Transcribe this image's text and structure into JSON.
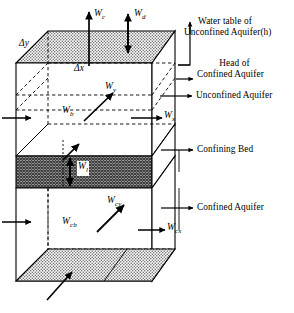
{
  "figure": {
    "type": "3d-block-diagram"
  },
  "dimension_labels": [
    {
      "id": "dy",
      "symbol": "Δy",
      "meaning": "cell width in y direction"
    },
    {
      "id": "dx",
      "symbol": "Δx",
      "meaning": "cell width in x direction"
    }
  ],
  "flux_labels": [
    {
      "id": "Wc",
      "base": "W",
      "sub": "c",
      "meaning": "recharge flux at water table, upward arrow"
    },
    {
      "id": "Wd",
      "base": "W",
      "sub": "d",
      "meaning": "drainage / exchange flux, double headed vertical arrow"
    },
    {
      "id": "Wy",
      "base": "W",
      "sub": "y",
      "meaning": "unconfined aquifer flux in y direction"
    },
    {
      "id": "Wb",
      "base": "W",
      "sub": "b",
      "meaning": "unconfined aquifer back face flux"
    },
    {
      "id": "Wx",
      "base": "W",
      "sub": "x",
      "meaning": "unconfined aquifer flux in x direction"
    },
    {
      "id": "Wl",
      "base": "W",
      "sub": "l",
      "meaning": "leakage flux through confining bed, double headed vertical arrow"
    },
    {
      "id": "Wcy",
      "base": "W",
      "sub": "cy",
      "meaning": "confined aquifer flux in y direction"
    },
    {
      "id": "Wcb",
      "base": "W",
      "sub": "cb",
      "meaning": "confined aquifer back face flux"
    },
    {
      "id": "Wcx",
      "base": "W",
      "sub": "cx",
      "meaning": "confined aquifer flux in x direction"
    }
  ],
  "annotations": [
    {
      "id": "water-table",
      "line1": "Water table of",
      "line2": "Unconfined Aquifer(h)"
    },
    {
      "id": "head-confined",
      "line1": "Head of",
      "line2": "Confined Aquifer"
    },
    {
      "id": "unconfined-aquifer",
      "line1": "Unconfined Aquifer",
      "line2": ""
    },
    {
      "id": "confining-bed",
      "line1": "Confining Bed",
      "line2": ""
    },
    {
      "id": "confined-aquifer",
      "line1": "Confined Aquifer",
      "line2": ""
    }
  ],
  "colors": {
    "stroke": "#000000",
    "background": "#ffffff",
    "top_face_fill": "#cfcfcf",
    "confining_bed_fill": "#8e8e8e",
    "bottom_face_fill": "#c6c6c6"
  }
}
